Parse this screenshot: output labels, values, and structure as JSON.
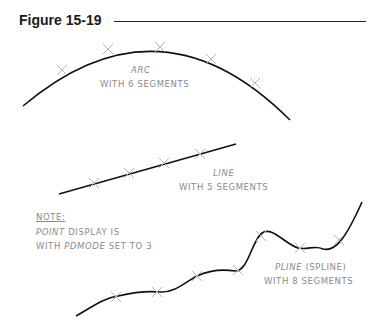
{
  "figure": {
    "title": "Figure 15-19"
  },
  "arc": {
    "name": "ARC",
    "desc": "WITH 6 SEGMENTS",
    "segments": 6
  },
  "line": {
    "name": "LINE",
    "desc": "WITH 5 SEGMENTS",
    "segments": 5
  },
  "note": {
    "heading": "NOTE:",
    "line1_italic": "POINT",
    "line1_rest": " DISPLAY IS",
    "line2_start": "WITH ",
    "line2_italic": "PDMODE",
    "line2_rest": " SET TO 3"
  },
  "pline": {
    "name": "PLINE",
    "name_suffix": " (SPLINE)",
    "desc": "WITH 8 SEGMENTS",
    "segments": 8
  },
  "colors": {
    "curve": "#111111",
    "marker": "#b5b5b5",
    "label": "#8a8a8a"
  }
}
